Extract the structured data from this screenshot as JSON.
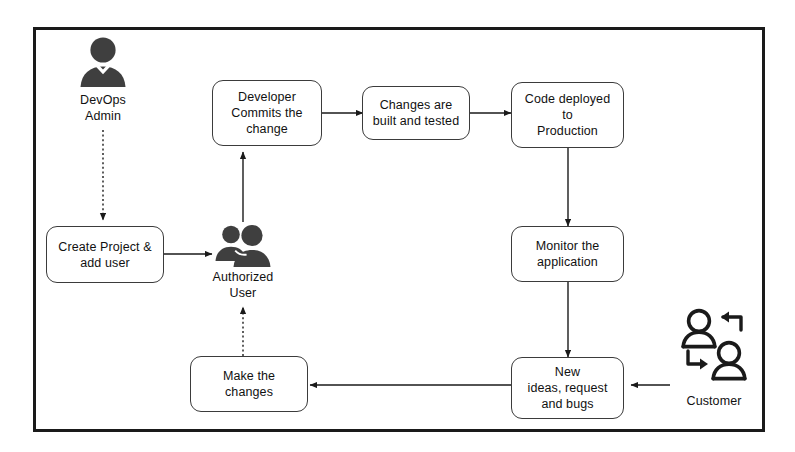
{
  "diagram": {
    "colors": {
      "frame": "#1a1a1a",
      "box_border": "#3b3b3b",
      "box_fill": "#ffffff",
      "text": "#111111",
      "icon_fill": "#3f3f3f",
      "connector": "#1a1a1a"
    },
    "boxes": [
      {
        "id": "developer-commits",
        "label": "Developer\nCommits the\nchange"
      },
      {
        "id": "changes-built",
        "label": "Changes are\nbuilt and tested"
      },
      {
        "id": "code-deployed",
        "label": "Code deployed\nto\nProduction"
      },
      {
        "id": "monitor-application",
        "label": "Monitor the\napplication"
      },
      {
        "id": "new-ideas",
        "label": "New\nideas, request\nand bugs"
      },
      {
        "id": "make-changes",
        "label": "Make the\nchanges"
      },
      {
        "id": "create-project",
        "label": "Create Project &\nadd user"
      }
    ],
    "actors": [
      {
        "id": "devops-admin",
        "label": "DevOps\nAdmin",
        "icon": "single-person-filled-icon"
      },
      {
        "id": "authorized-user",
        "label": "Authorized\nUser",
        "icon": "two-people-filled-icon"
      },
      {
        "id": "customer",
        "label": "Customer",
        "icon": "two-people-outline-exchange-icon"
      }
    ],
    "connectors": [
      {
        "id": "devops-admin-to-create-project",
        "style": "dashed",
        "from": "devops-admin",
        "to": "create-project"
      },
      {
        "id": "create-project-to-authorized-user",
        "style": "solid",
        "from": "create-project",
        "to": "authorized-user"
      },
      {
        "id": "authorized-user-to-developer-commits",
        "style": "solid",
        "from": "authorized-user",
        "to": "developer-commits"
      },
      {
        "id": "developer-commits-to-changes-built",
        "style": "solid",
        "from": "developer-commits",
        "to": "changes-built"
      },
      {
        "id": "changes-built-to-code-deployed",
        "style": "solid",
        "from": "changes-built",
        "to": "code-deployed"
      },
      {
        "id": "code-deployed-to-monitor",
        "style": "solid",
        "from": "code-deployed",
        "to": "monitor-application"
      },
      {
        "id": "monitor-to-new-ideas",
        "style": "solid",
        "from": "monitor-application",
        "to": "new-ideas"
      },
      {
        "id": "customer-to-new-ideas",
        "style": "solid",
        "from": "customer",
        "to": "new-ideas"
      },
      {
        "id": "new-ideas-to-make-changes",
        "style": "solid",
        "from": "new-ideas",
        "to": "make-changes"
      },
      {
        "id": "make-changes-to-authorized-user",
        "style": "dashed",
        "from": "make-changes",
        "to": "authorized-user"
      }
    ]
  }
}
